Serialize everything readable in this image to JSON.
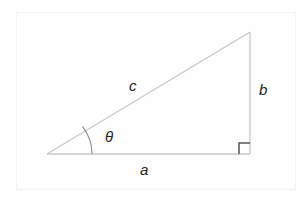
{
  "diagram": {
    "labels": {
      "hypotenuse": "c",
      "opposite": "b",
      "adjacent": "a",
      "angle": "θ"
    },
    "colors": {
      "lines": "#c8c8c8",
      "right_angle_marker": "#555555",
      "arc": "#8a8a8a",
      "text": "#222222"
    }
  }
}
